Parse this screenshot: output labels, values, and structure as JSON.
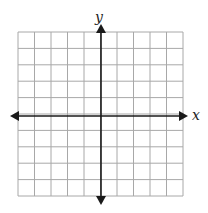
{
  "diagram": {
    "type": "coordinate-plane",
    "grid": {
      "columns": 10,
      "rows": 10,
      "line_color": "#a8a8a8",
      "axis_color": "#1a1a1a"
    },
    "labels": {
      "x_axis": "x",
      "y_axis": "y"
    }
  }
}
